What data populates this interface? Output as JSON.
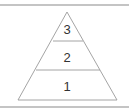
{
  "diagram": {
    "type": "pyramid",
    "tiers": [
      {
        "label": "3",
        "level": "top"
      },
      {
        "label": "2",
        "level": "middle"
      },
      {
        "label": "1",
        "level": "bottom"
      }
    ],
    "colors": {
      "rule": "#8a8a8a",
      "edge": "#9a9a9a",
      "text": "#333333"
    }
  }
}
